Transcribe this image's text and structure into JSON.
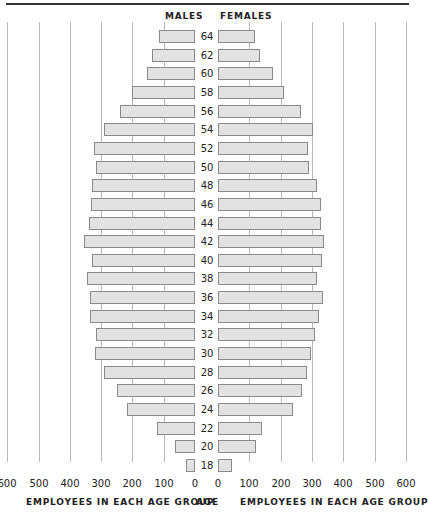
{
  "chart_data": {
    "type": "bar",
    "orientation": "horizontal",
    "subtype": "population-pyramid",
    "title": "",
    "left_header": "MALES",
    "right_header": "FEMALES",
    "center_axis_label": "AGE",
    "left_xlabel": "EMPLOYEES IN EACH AGE GROUP",
    "right_xlabel": "EMPLOYEES IN EACH AGE GROUP",
    "xlim": [
      0,
      600
    ],
    "left_ticks": [
      "600",
      "500",
      "400",
      "300",
      "200",
      "100",
      "0"
    ],
    "right_ticks": [
      "0",
      "100",
      "200",
      "300",
      "400",
      "500",
      "600"
    ],
    "grid": true,
    "categories": [
      "64",
      "62",
      "60",
      "58",
      "56",
      "54",
      "52",
      "50",
      "48",
      "46",
      "44",
      "42",
      "40",
      "38",
      "36",
      "34",
      "32",
      "30",
      "28",
      "26",
      "24",
      "22",
      "20",
      "18"
    ],
    "series": [
      {
        "name": "MALES",
        "side": "left",
        "values": [
          115,
          137,
          153,
          201,
          240,
          290,
          322,
          316,
          328,
          332,
          339,
          355,
          329,
          345,
          335,
          335,
          316,
          318,
          290,
          250,
          218,
          121,
          63,
          29
        ]
      },
      {
        "name": "FEMALES",
        "side": "right",
        "values": [
          118,
          134,
          176,
          211,
          265,
          304,
          288,
          291,
          316,
          329,
          329,
          339,
          332,
          317,
          335,
          323,
          310,
          297,
          284,
          268,
          240,
          141,
          121,
          45
        ]
      }
    ],
    "colors": {
      "bar_fill": "#e2e2e2",
      "bar_border": "#8a8a8a",
      "gridline": "#b8b8b8"
    }
  }
}
